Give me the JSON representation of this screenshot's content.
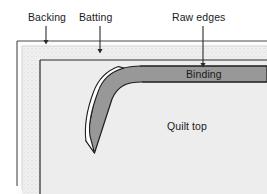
{
  "diagram": {
    "labels": {
      "backing": "Backing",
      "batting": "Batting",
      "raw_edges": "Raw edges",
      "binding": "Binding",
      "quilt_top": "Quilt top"
    },
    "callouts": [
      {
        "name": "backing-callout",
        "label": "Backing",
        "arrow_x": 46,
        "arrow_top": 26,
        "arrow_bottom": 43
      },
      {
        "name": "batting-callout",
        "label": "Batting",
        "arrow_x": 100,
        "arrow_top": 26,
        "arrow_bottom": 52
      },
      {
        "name": "raw-edges-callout",
        "label": "Raw edges",
        "arrow_x": 203,
        "arrow_top": 26,
        "arrow_bottom": 66
      }
    ],
    "layers": [
      {
        "name": "backing",
        "label": "Backing",
        "color": "#fbfbfb"
      },
      {
        "name": "batting",
        "label": "Batting",
        "color": "#eeeeee"
      },
      {
        "name": "quilt-top",
        "label": "Quilt top",
        "color": "#ededed"
      },
      {
        "name": "binding",
        "label": "Binding",
        "color": "#9a9a9a"
      }
    ],
    "colors": {
      "background": "#ffffff",
      "outline": "#2b2b2b",
      "backing_fill": "#fbfbfb",
      "batting_fill": "#ededed",
      "quilt_top_fill": "#ededed",
      "binding_fill": "#989898",
      "binding_fold_fill": "#ffffff",
      "arrow": "#2b2b2b",
      "text": "#1a1a1a"
    }
  }
}
